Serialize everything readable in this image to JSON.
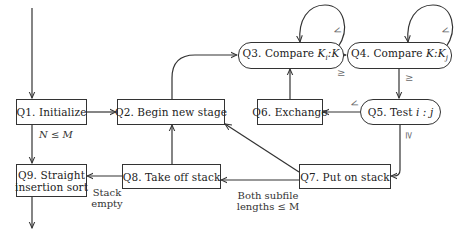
{
  "diagram": {
    "nodes": [
      {
        "id": "Q1",
        "label": "Q1. Initialize"
      },
      {
        "id": "Q2",
        "label": "Q2. Begin new stage"
      },
      {
        "id": "Q3",
        "label": "Q3. Compare Kᵢ:K",
        "prefix": "Q3. Compare ",
        "math": "K",
        "sub": "i",
        "suffix": ":K"
      },
      {
        "id": "Q4",
        "label": "Q4. Compare K:Kⱼ",
        "prefix": "Q4. Compare ",
        "math": "K:K",
        "sub": "j"
      },
      {
        "id": "Q5",
        "label": "Q5. Test i : j",
        "prefix": "Q5. Test ",
        "math": "i : j"
      },
      {
        "id": "Q6",
        "label": "Q6. Exchange"
      },
      {
        "id": "Q7",
        "label": "Q7. Put on stack"
      },
      {
        "id": "Q8",
        "label": "Q8. Take off stack"
      },
      {
        "id": "Q9",
        "label_line1": "Q9. Straight",
        "label_line2": "insertion sort"
      }
    ],
    "edge_labels": {
      "q1_q9": "N ≤ M",
      "q8_q9_line1": "Stack",
      "q8_q9_line2": "empty",
      "q7_q8_line1": "Both subfile",
      "q7_q8_line2": "lengths ≤ M",
      "q3_loop": "<",
      "q3_q4": "≥",
      "q4_loop": "<",
      "q4_q5": "≥",
      "q5_q6": "<",
      "q5_q7": "≥"
    },
    "edges": [
      {
        "from": "start",
        "to": "Q1"
      },
      {
        "from": "Q1",
        "to": "Q2"
      },
      {
        "from": "Q1",
        "to": "Q9",
        "label": "N ≤ M"
      },
      {
        "from": "Q2",
        "to": "Q3"
      },
      {
        "from": "Q3",
        "to": "Q3",
        "label": "<"
      },
      {
        "from": "Q3",
        "to": "Q4",
        "label": "≥"
      },
      {
        "from": "Q4",
        "to": "Q4",
        "label": "<"
      },
      {
        "from": "Q4",
        "to": "Q5",
        "label": "≥"
      },
      {
        "from": "Q5",
        "to": "Q6",
        "label": "<"
      },
      {
        "from": "Q5",
        "to": "Q7",
        "label": "≥"
      },
      {
        "from": "Q6",
        "to": "Q3"
      },
      {
        "from": "Q7",
        "to": "Q2"
      },
      {
        "from": "Q7",
        "to": "Q8",
        "label": "Both subfile lengths ≤ M"
      },
      {
        "from": "Q8",
        "to": "Q2"
      },
      {
        "from": "Q8",
        "to": "Q9",
        "label": "Stack empty"
      },
      {
        "from": "Q9",
        "to": "end"
      }
    ]
  }
}
